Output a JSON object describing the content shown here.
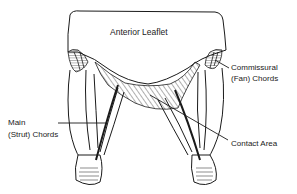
{
  "diagram": {
    "labels": {
      "anterior_leaflet": "Anterior Leaflet",
      "commissural_line1": "Commissural",
      "commissural_line2": "(Fan) Chords",
      "main_line1": "Main",
      "main_line2": "(Strut) Chords",
      "contact_area": "Contact Area"
    },
    "colors": {
      "ink": "#1a1a1a",
      "background": "#ffffff"
    }
  }
}
